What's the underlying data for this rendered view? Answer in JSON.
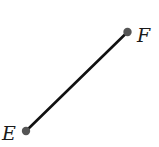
{
  "diagram": {
    "type": "line-segment",
    "segment": {
      "from": "E",
      "to": "F",
      "color": "#111111"
    },
    "points": [
      {
        "label": "E",
        "x": 26,
        "y": 131,
        "dot_color": "#555555"
      },
      {
        "label": "F",
        "x": 127.5,
        "y": 32,
        "dot_color": "#555555"
      }
    ]
  }
}
